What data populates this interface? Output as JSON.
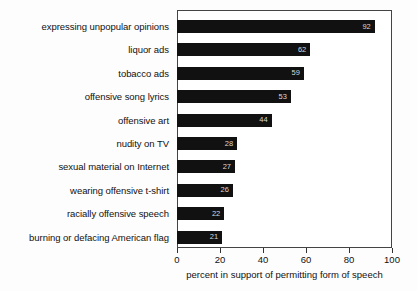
{
  "chart_data": {
    "type": "bar",
    "orientation": "horizontal",
    "title": "",
    "xlabel": "percent in support of permitting form of speech",
    "ylabel": "",
    "xlim": [
      0,
      100
    ],
    "xticks": [
      0,
      20,
      40,
      60,
      80,
      100
    ],
    "xtick_labels": [
      "0",
      "20",
      "40",
      "60",
      "80",
      "100"
    ],
    "grid": false,
    "legend": false,
    "bar_color": "#111111",
    "value_label_color": "#d8d8d8",
    "frame_color": "#444444",
    "categories": [
      "expressing unpopular opinions",
      "liquor ads",
      "tobacco ads",
      "offensive song lyrics",
      "offensive art",
      "nudity on TV",
      "sexual material on Internet",
      "wearing offensive t-shirt",
      "racially offensive speech",
      "burning or defacing American flag"
    ],
    "values": [
      92,
      62,
      59,
      53,
      44,
      28,
      27,
      26,
      22,
      21
    ],
    "value_labels": [
      "92",
      "62",
      "59",
      "53",
      "44",
      "28",
      "27",
      "26",
      "22",
      "21"
    ]
  }
}
